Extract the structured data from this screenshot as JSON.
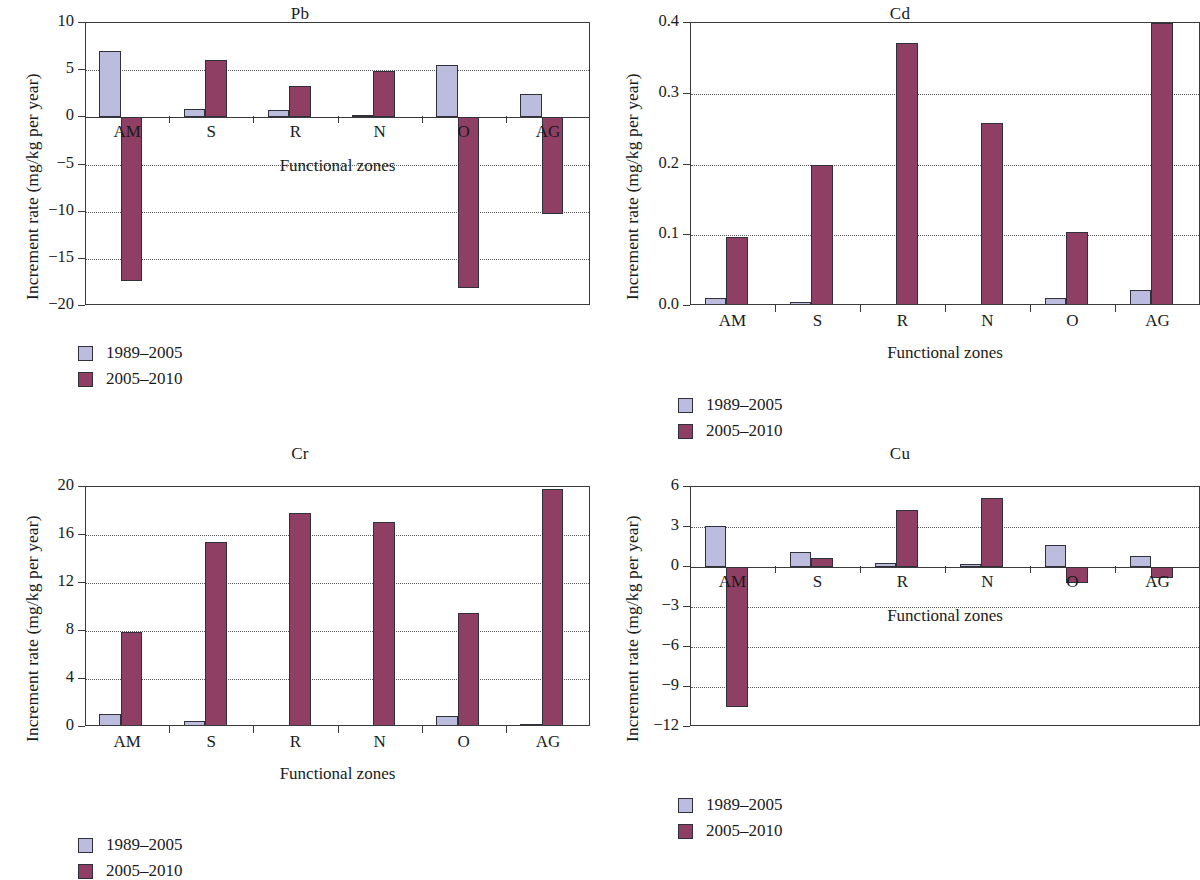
{
  "figure": {
    "series_labels": [
      "1989–2005",
      "2005–2010"
    ],
    "colors": {
      "series1": "#bcbcdf",
      "series2": "#8f3f63"
    },
    "axis_title_y": "Increment rate (mg/kg per year)",
    "axis_title_x": "Functional zones",
    "categories": [
      "AM",
      "S",
      "R",
      "N",
      "O",
      "AG"
    ]
  },
  "panels": {
    "pb": {
      "title": "Pb",
      "ylabel": "Increment rate (mg/kg per year)",
      "xlabel": "Functional zones",
      "yticks": [
        "10",
        "5",
        "0",
        "−5",
        "−10",
        "−15",
        "−20"
      ]
    },
    "cd": {
      "title": "Cd",
      "ylabel": "Increment rate (mg/kg per year)",
      "xlabel": "Functional zones",
      "yticks": [
        "0.4",
        "0.3",
        "0.2",
        "0.1",
        "0.0"
      ]
    },
    "cr": {
      "title": "Cr",
      "ylabel": "Increment rate (mg/kg per year)",
      "xlabel": "Functional zones",
      "yticks": [
        "20",
        "16",
        "12",
        "8",
        "4",
        "0"
      ]
    },
    "cu": {
      "title": "Cu",
      "ylabel": "Increment rate (mg/kg per year)",
      "xlabel": "Functional zones",
      "yticks": [
        "6",
        "3",
        "0",
        "−3",
        "−6",
        "−9",
        "−12"
      ]
    }
  },
  "legends": {
    "pb": {
      "series1": "1989–2005",
      "series2": "2005–2010"
    },
    "cd": {
      "series1": "1989–2005",
      "series2": "2005–2010"
    },
    "cr": {
      "series1": "1989–2005",
      "series2": "2005–2010"
    },
    "cu": {
      "series1": "1989–2005",
      "series2": "2005–2010"
    }
  },
  "chart_data": [
    {
      "id": "pb",
      "type": "bar",
      "title": "Pb",
      "xlabel": "Functional zones",
      "ylabel": "Increment rate (mg/kg per year)",
      "categories": [
        "AM",
        "S",
        "R",
        "N",
        "O",
        "AG"
      ],
      "ylim": [
        -20,
        10
      ],
      "yticks": [
        10,
        5,
        0,
        -5,
        -10,
        -15,
        -20
      ],
      "grid": true,
      "legend_position": "below-left",
      "series": [
        {
          "name": "1989–2005",
          "color": "#bcbcdf",
          "values": [
            7.0,
            0.9,
            0.8,
            0.25,
            5.5,
            2.5
          ]
        },
        {
          "name": "2005–2010",
          "color": "#8f3f63",
          "values": [
            -17.3,
            6.05,
            3.35,
            4.9,
            -18.1,
            -10.2
          ]
        }
      ]
    },
    {
      "id": "cd",
      "type": "bar",
      "title": "Cd",
      "xlabel": "Functional zones",
      "ylabel": "Increment rate (mg/kg per year)",
      "categories": [
        "AM",
        "S",
        "R",
        "N",
        "O",
        "AG"
      ],
      "ylim": [
        0.0,
        0.4
      ],
      "yticks": [
        0.4,
        0.3,
        0.2,
        0.1,
        0.0
      ],
      "grid": true,
      "legend_position": "below-left",
      "series": [
        {
          "name": "1989–2005",
          "color": "#bcbcdf",
          "values": [
            0.011,
            0.006,
            0.002,
            0.001,
            0.011,
            0.023
          ]
        },
        {
          "name": "2005–2010",
          "color": "#8f3f63",
          "values": [
            0.098,
            0.199,
            0.372,
            0.259,
            0.105,
            0.4
          ]
        }
      ]
    },
    {
      "id": "cr",
      "type": "bar",
      "title": "Cr",
      "xlabel": "Functional zones",
      "ylabel": "Increment rate (mg/kg per year)",
      "categories": [
        "AM",
        "S",
        "R",
        "N",
        "O",
        "AG"
      ],
      "ylim": [
        0,
        20
      ],
      "yticks": [
        20,
        16,
        12,
        8,
        4,
        0
      ],
      "grid": true,
      "legend_position": "below-left",
      "series": [
        {
          "name": "1989–2005",
          "color": "#bcbcdf",
          "values": [
            1.1,
            0.5,
            0.15,
            0.12,
            0.95,
            0.25
          ]
        },
        {
          "name": "2005–2010",
          "color": "#8f3f63",
          "values": [
            7.9,
            15.4,
            17.8,
            17.1,
            9.5,
            19.8
          ]
        }
      ]
    },
    {
      "id": "cu",
      "type": "bar",
      "title": "Cu",
      "xlabel": "Functional zones",
      "ylabel": "Increment rate (mg/kg per year)",
      "categories": [
        "AM",
        "S",
        "R",
        "N",
        "O",
        "AG"
      ],
      "ylim": [
        -12,
        6
      ],
      "yticks": [
        6,
        3,
        0,
        -3,
        -6,
        -9,
        -12
      ],
      "grid": true,
      "legend_position": "below-left",
      "series": [
        {
          "name": "1989–2005",
          "color": "#bcbcdf",
          "values": [
            3.05,
            1.15,
            0.3,
            0.25,
            1.65,
            0.85
          ]
        },
        {
          "name": "2005–2010",
          "color": "#8f3f63",
          "values": [
            -10.5,
            0.7,
            4.3,
            5.2,
            -1.2,
            -0.8
          ]
        }
      ]
    }
  ]
}
